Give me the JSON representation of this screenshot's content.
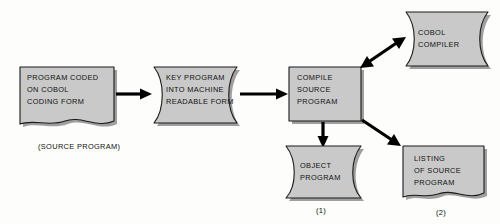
{
  "diagram": {
    "background_color": "#fdfdfb",
    "shape_fill_color": "#c9c9c9",
    "shape_stroke_color": "#1a1a1a",
    "connector_color": "#000000",
    "nodes": [
      {
        "id": "source-document",
        "shape": "document",
        "lines": [
          "PROGRAM CODED",
          "ON COBOL",
          "CODING FORM"
        ]
      },
      {
        "id": "key-program",
        "shape": "stored-data-double-concave",
        "lines": [
          "KEY PROGRAM",
          "INTO MACHINE",
          "READABLE FORM"
        ]
      },
      {
        "id": "compile-source",
        "shape": "process-rectangle",
        "lines": [
          "COMPILE",
          "SOURCE",
          "PROGRAM"
        ]
      },
      {
        "id": "cobol-compiler",
        "shape": "stored-data",
        "lines": [
          "COBOL",
          "COMPILER"
        ]
      },
      {
        "id": "object-program",
        "shape": "stored-data",
        "lines": [
          "OBJECT",
          "PROGRAM"
        ]
      },
      {
        "id": "listing-of-source",
        "shape": "document",
        "lines": [
          "LISTING",
          "OF SOURCE",
          "PROGRAM"
        ]
      }
    ],
    "captions": [
      {
        "id": "source-program-caption",
        "text": "(SOURCE PROGRAM)"
      },
      {
        "id": "object-program-ref",
        "text": "(1)"
      },
      {
        "id": "listing-of-source-ref",
        "text": "(2)"
      }
    ],
    "connectors": [
      {
        "id": "source-to-key",
        "from": "source-document",
        "to": "key-program",
        "arrows": "single"
      },
      {
        "id": "key-to-compile",
        "from": "key-program",
        "to": "compile-source",
        "arrows": "single"
      },
      {
        "id": "compile-to-compiler",
        "from": "compile-source",
        "to": "cobol-compiler",
        "arrows": "double"
      },
      {
        "id": "compile-to-object",
        "from": "compile-source",
        "to": "object-program",
        "arrows": "single"
      },
      {
        "id": "compile-to-listing",
        "from": "compile-source",
        "to": "listing-of-source",
        "arrows": "single"
      }
    ]
  }
}
